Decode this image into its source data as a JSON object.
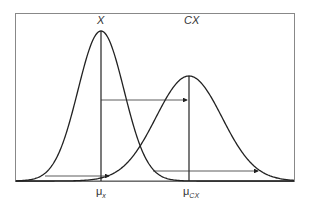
{
  "diagram": {
    "curves": [
      {
        "label": "X",
        "mean_label": "μ",
        "mean_sub": "x",
        "peak_x": 101,
        "peak_y": 31,
        "sigma": 23
      },
      {
        "label": "CX",
        "mean_label": "μ",
        "mean_sub": "CX",
        "peak_x": 189,
        "peak_y": 76,
        "sigma": 33
      }
    ],
    "colors": {
      "line": "#222222",
      "frame": "#888888"
    }
  }
}
